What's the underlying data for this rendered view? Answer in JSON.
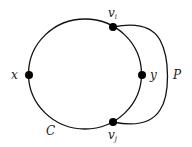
{
  "diagram": {
    "type": "graph-cycle-with-path",
    "cycle": {
      "label": "C",
      "center": [
        85,
        75
      ],
      "rx": 56,
      "ry": 55
    },
    "path": {
      "label": "P",
      "from": "v_i",
      "to": "v_j"
    },
    "vertices": [
      {
        "id": "v_i",
        "base": "v",
        "sub": "i",
        "x": 113,
        "y": 27
      },
      {
        "id": "v_j",
        "base": "v",
        "sub": "j",
        "x": 113,
        "y": 122
      },
      {
        "id": "x",
        "base": "x",
        "sub": "",
        "x": 29,
        "y": 75
      },
      {
        "id": "y",
        "base": "y",
        "sub": "",
        "x": 142,
        "y": 75
      }
    ],
    "labels": {
      "vi_base": "v",
      "vi_sub": "i",
      "vj_base": "v",
      "vj_sub": "j",
      "x": "x",
      "y": "y",
      "C": "C",
      "P": "P"
    },
    "colors": {
      "stroke": "#111111",
      "vertex": "#000000",
      "background": "#ffffff"
    }
  }
}
